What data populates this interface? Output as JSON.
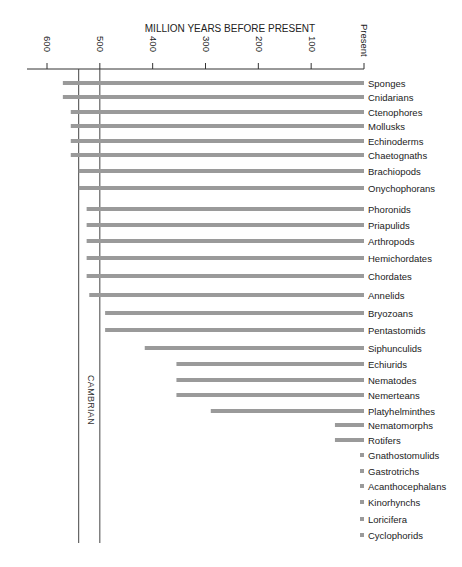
{
  "chart_data": {
    "type": "bar",
    "orientation": "horizontal",
    "title": "",
    "xlabel": "MILLION YEARS BEFORE PRESENT",
    "ylabel": "",
    "xlim": [
      600,
      0
    ],
    "x_ticks": [
      {
        "value": 600,
        "label": "600"
      },
      {
        "value": 500,
        "label": "500"
      },
      {
        "value": 400,
        "label": "400"
      },
      {
        "value": 300,
        "label": "300"
      },
      {
        "value": 200,
        "label": "200"
      },
      {
        "value": 100,
        "label": "100"
      },
      {
        "value": 0,
        "label": "Present"
      }
    ],
    "grid": false,
    "legend": "none",
    "annotations": [
      {
        "label": "CAMBRIAN",
        "start": 540,
        "end": 500
      }
    ],
    "categories": [
      "Sponges",
      "Cnidarians",
      "Ctenophores",
      "Mollusks",
      "Echinoderms",
      "Chaetognaths",
      "Brachiopods",
      "Onychophorans",
      "Phoronids",
      "Priapulids",
      "Arthropods",
      "Hemichordates",
      "Chordates",
      "Annelids",
      "Bryozoans",
      "Pentastomids",
      "Siphunculids",
      "Echiurids",
      "Nematodes",
      "Nemerteans",
      "Platyhelminthes",
      "Nematomorphs",
      "Rotifers",
      "Gnathostomulids",
      "Gastrotrichs",
      "Acanthocephalans",
      "Kinorhynchs",
      "Loricifera",
      "Cyclophorids"
    ],
    "series": [
      {
        "name": "First appearance (Ma)",
        "values": [
          570,
          570,
          555,
          555,
          555,
          555,
          540,
          540,
          525,
          525,
          525,
          525,
          525,
          520,
          490,
          490,
          415,
          355,
          355,
          355,
          290,
          55,
          55,
          5,
          5,
          5,
          5,
          5,
          5
        ]
      }
    ],
    "colors": {
      "bar": "#9a9a9a",
      "axis": "#333333",
      "text": "#222222"
    }
  }
}
